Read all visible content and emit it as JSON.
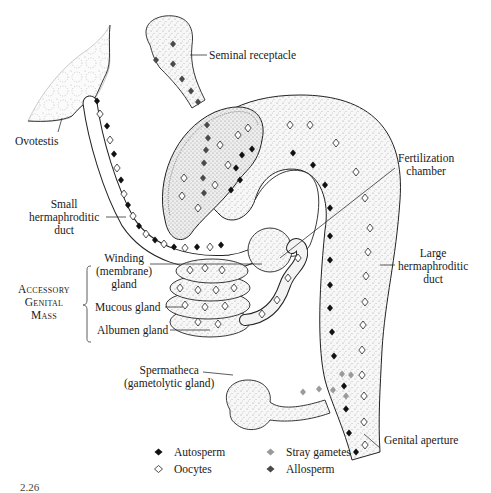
{
  "figure": {
    "caption_fragment": "2.26",
    "labels": {
      "seminal_receptacle": "Seminal receptacle",
      "ovotestis": "Ovotestis",
      "fertilization_chamber": [
        "Fertilization",
        "chamber"
      ],
      "small_hermaphroditic_duct": [
        "Small",
        "hermaphroditic",
        "duct"
      ],
      "large_hermaphroditic_duct": [
        "Large",
        "hermaphroditic",
        "duct"
      ],
      "accessory_genital_mass": [
        "Accessory",
        "Genital",
        "Mass"
      ],
      "winding_gland": [
        "Winding",
        "(membrane)",
        "gland"
      ],
      "mucous_gland": "Mucous gland",
      "albumen_gland": "Albumen gland",
      "spermatheca": [
        "Spermatheca",
        "(gametolytic gland)"
      ],
      "genital_aperture": "Genital aperture"
    },
    "legend": [
      {
        "label": "Autosperm",
        "marker": "filled-diamond",
        "color": "#111111"
      },
      {
        "label": "Oocytes",
        "marker": "open-diamond",
        "color": "#ffffff"
      },
      {
        "label": "Stray gametes",
        "marker": "filled-diamond",
        "color": "#9a9a9a"
      },
      {
        "label": "Allosperm",
        "marker": "filled-diamond",
        "color": "#4a4a4a"
      }
    ],
    "colors": {
      "ink": "#1a1a1a",
      "stipple": "#cfcfcf",
      "organ_fill": "#f3f3f3"
    }
  }
}
